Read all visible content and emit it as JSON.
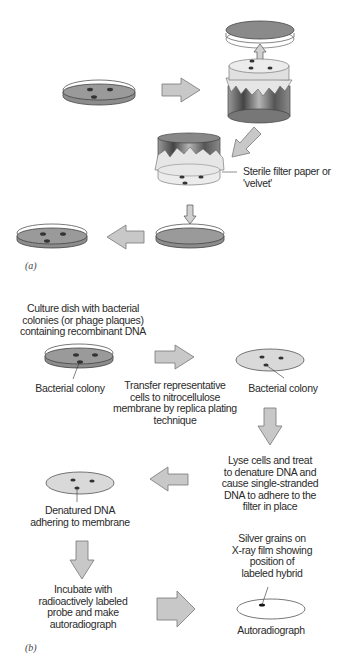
{
  "figure": {
    "panel_a": {
      "label": "(a)",
      "annotations": {
        "sterile_filter": "Sterile filter paper or 'velvet'"
      },
      "steps": [
        {
          "id": "master-plate",
          "description": "Petri dish with colonies"
        },
        {
          "id": "velvet-block-press",
          "description": "Velvet-covered block pressed onto plate"
        },
        {
          "id": "velvet-block-transfer",
          "description": "Velvet block with colonies transferred"
        },
        {
          "id": "fresh-plate",
          "description": "Fresh plate receiving imprint"
        },
        {
          "id": "replica-plate",
          "description": "Replica plate with colonies"
        }
      ]
    },
    "panel_b": {
      "label": "(b)",
      "texts": {
        "culture_dish": "Culture dish with bacterial colonies (or phage plaques) containing recombinant DNA",
        "culture_dish_lines": [
          "Culture dish with bacterial",
          "colonies (or phage plaques)",
          "containing recombinant DNA"
        ],
        "bacterial_colony_left": "Bacterial colony",
        "transfer_lines": [
          "Transfer representative",
          "cells to nitrocellulose",
          "membrane by replica plating",
          "technique"
        ],
        "bacterial_colony_right": "Bacterial colony",
        "lyse_lines": [
          "Lyse cells and treat",
          "to denature DNA and",
          "cause single-stranded",
          "DNA to adhere to the",
          "filter in place"
        ],
        "denatured_lines": [
          "Denatured DNA",
          "adhering to membrane"
        ],
        "silver_lines": [
          "Silver grains on",
          "X-ray film showing",
          "position of",
          "labeled hybrid"
        ],
        "incubate_lines": [
          "Incubate with",
          "radioactively labeled",
          "probe and make",
          "autoradiograph"
        ],
        "autoradiograph": "Autoradiograph"
      }
    },
    "colors": {
      "arrow_fill": "#c8c8c8",
      "arrow_stroke": "#6a6a6a",
      "agar_dark": "#8c8c8c",
      "membrane_fill": "#d9d9d9",
      "colony": "#3a3a3a",
      "cylinder_dark": "#5a5a5a",
      "velvet": "#e8e8e8"
    }
  }
}
